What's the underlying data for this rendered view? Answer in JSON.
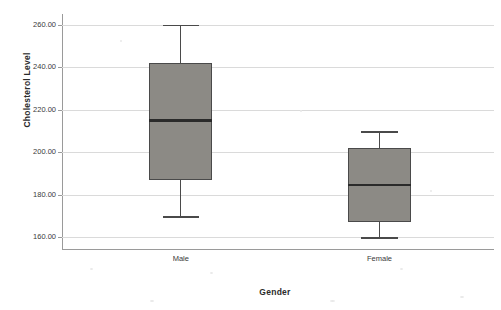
{
  "chart_data": {
    "type": "box",
    "title": "",
    "xlabel": "Gender",
    "ylabel": "Cholesterol Level",
    "categories": [
      "Male",
      "Female"
    ],
    "ylim": [
      155,
      265
    ],
    "yticks": [
      160,
      180,
      200,
      220,
      240,
      260
    ],
    "ytick_labels": [
      "160.00",
      "180.00",
      "200.00",
      "220.00",
      "240.00",
      "260.00"
    ],
    "grid": true,
    "legend": "none",
    "boxes": [
      {
        "category": "Male",
        "whisker_low": 170.0,
        "q1": 187.0,
        "median": 215.0,
        "q3": 242.0,
        "whisker_high": 260.0
      },
      {
        "category": "Female",
        "whisker_low": 160.0,
        "q1": 167.0,
        "median": 184.5,
        "q3": 202.0,
        "whisker_high": 210.0
      }
    ],
    "colors": {
      "box_fill": "#8c8a85",
      "box_border": "#4a4a4a",
      "median": "#2a2a2a",
      "gridline": "#dadada",
      "axis": "#9a9a9a",
      "text": "#3a3a3a"
    }
  }
}
